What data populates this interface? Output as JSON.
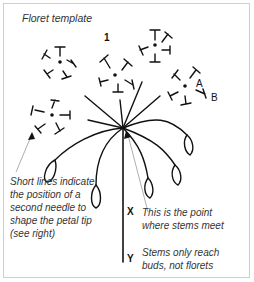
{
  "title": "Floret template",
  "labels": {
    "one": "1",
    "a": "A",
    "b": "B",
    "x": "X",
    "y": "Y"
  },
  "notes": {
    "short_lines": "Short lines indicate the position of a second needle to shape the petal tip (see right)",
    "point": "This is the point where stems meet",
    "stems": "Stems only reach buds, not florets"
  },
  "colors": {
    "ink": "#111111",
    "note_text": "#333333",
    "pointer_line": "#999999",
    "frame_border": "#cfcfcf"
  }
}
